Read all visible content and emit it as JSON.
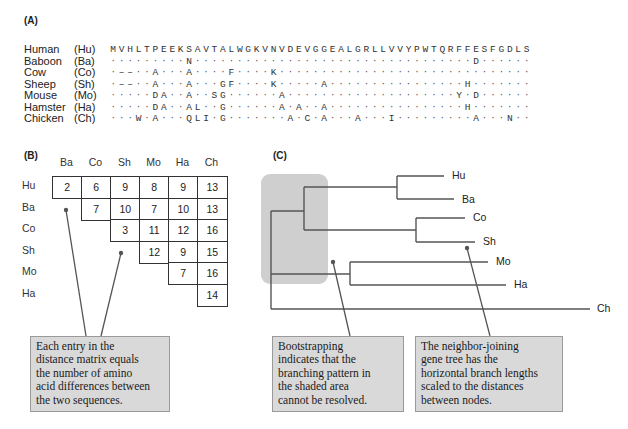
{
  "panels": {
    "a": {
      "label": "(A)"
    },
    "b": {
      "label": "(B)"
    },
    "c": {
      "label": "(C)"
    }
  },
  "alignment": {
    "reference": "MVHLTPEEKSAVTALWGKVNVDEVGGEALGRLLVVYPWTQRFFESFGDLS",
    "rows": [
      {
        "name": "Human",
        "abbr": "(Hu)",
        "seq": "MVHLTPEEKSAVTALWGKVNVDEVGGEALGRLLVVYPWTQRFFESFGDLS"
      },
      {
        "name": "Baboon",
        "abbr": "(Ba)",
        "seq": ".........N.................................D......"
      },
      {
        "name": "Cow",
        "abbr": "(Co)",
        "seq": ".--..A...A....F....K.............................."
      },
      {
        "name": "Sheep",
        "abbr": "(Sh)",
        "seq": ".--..A...A...GF....K.....A................H......."
      },
      {
        "name": "Mouse",
        "abbr": "(Mo)",
        "seq": ".....DA..A..SG......A....................Y.D......"
      },
      {
        "name": "Hamster",
        "abbr": "(Ha)",
        "seq": ".....DA..AL..G......A.A..A................H......."
      },
      {
        "name": "Chicken",
        "abbr": "(Ch)",
        "seq": "...W.A...QLI.G.......A.C.A...A...I.........A...N.."
      }
    ]
  },
  "distance_matrix": {
    "columns": [
      "Ba",
      "Co",
      "Sh",
      "Mo",
      "Ha",
      "Ch"
    ],
    "rows": [
      "Hu",
      "Ba",
      "Co",
      "Sh",
      "Mo",
      "Ha"
    ],
    "values": [
      [
        2,
        6,
        9,
        8,
        9,
        13
      ],
      [
        null,
        7,
        10,
        7,
        10,
        13
      ],
      [
        null,
        null,
        3,
        11,
        12,
        16
      ],
      [
        null,
        null,
        null,
        12,
        9,
        15
      ],
      [
        null,
        null,
        null,
        null,
        7,
        16
      ],
      [
        null,
        null,
        null,
        null,
        null,
        14
      ]
    ]
  },
  "tree": {
    "leaves": [
      "Hu",
      "Ba",
      "Co",
      "Sh",
      "Mo",
      "Ha",
      "Ch"
    ],
    "shaded_color": "#cfcfcf",
    "line_color": "#555555"
  },
  "callouts": {
    "matrix": "Each entry in the distance matrix equals the number of amino acid differences between the two sequences.",
    "bootstrap": "Bootstrapping indicates that the branching pattern in the shaded area cannot be resolved.",
    "neighbor_joining": "The neighbor-joining gene tree has the horizontal branch lengths scaled to the distances between nodes."
  },
  "callout_lines": {
    "matrix": [
      "Each entry in the",
      "distance matrix equals",
      "the number of amino",
      "acid differences between",
      "the two sequences."
    ],
    "bootstrap": [
      "Bootstrapping",
      "indicates that the",
      "branching pattern in",
      "the shaded area",
      "cannot be resolved."
    ],
    "neighbor_joining": [
      "The neighbor-joining",
      "gene tree has the",
      "horizontal branch lengths",
      "scaled to the distances",
      "between nodes."
    ]
  }
}
